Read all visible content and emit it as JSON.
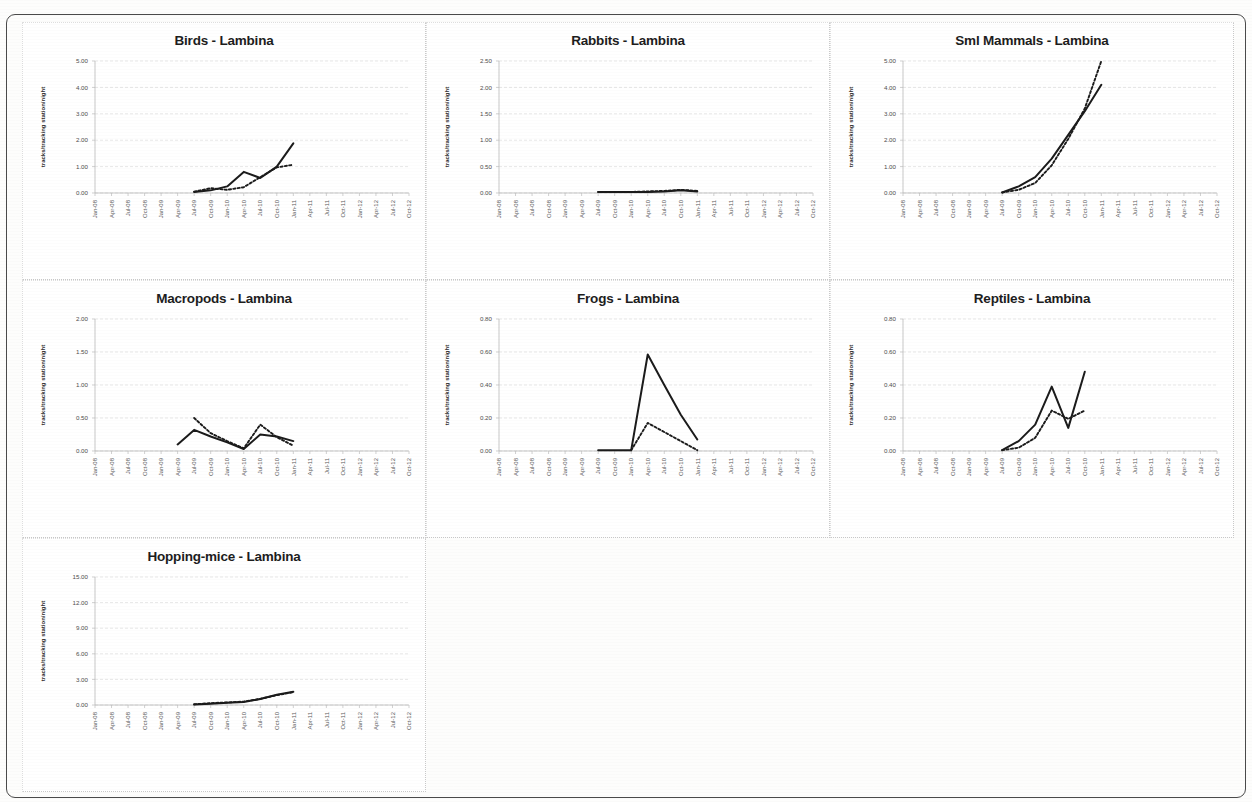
{
  "page": {
    "site": "Lambina",
    "y_axis_label": "tracks/tracking station/night",
    "categories": [
      "Jan-08",
      "Apr-08",
      "Jul-08",
      "Oct-08",
      "Jan-09",
      "Apr-09",
      "Jul-09",
      "Oct-09",
      "Jan-10",
      "Apr-10",
      "Jul-10",
      "Oct-10",
      "Jan-11",
      "Apr-11",
      "Jul-11",
      "Oct-11",
      "Jan-12",
      "Apr-12",
      "Jul-12",
      "Oct-12"
    ],
    "series_names": [
      "observed (solid)",
      "trend (dotted)"
    ],
    "line_color": "#1b1b1b"
  },
  "chart_data": [
    {
      "type": "line",
      "title": "Birds - Lambina",
      "xlabel": "",
      "ylabel": "tracks/tracking station/night",
      "grid": true,
      "legend": "none",
      "ylim": [
        0,
        5
      ],
      "yticks": [
        0,
        1,
        2,
        3,
        4,
        5
      ],
      "ytick_labels": [
        "0.00",
        "1.00",
        "2.00",
        "3.00",
        "4.00",
        "5.00"
      ],
      "categories": [
        "Jan-08",
        "Apr-08",
        "Jul-08",
        "Oct-08",
        "Jan-09",
        "Apr-09",
        "Jul-09",
        "Oct-09",
        "Jan-10",
        "Apr-10",
        "Jul-10",
        "Oct-10",
        "Jan-11",
        "Apr-11",
        "Jul-11",
        "Oct-11",
        "Jan-12",
        "Apr-12",
        "Jul-12",
        "Oct-12"
      ],
      "series": [
        {
          "name": "observed (solid)",
          "style": "solid",
          "x": [
            "Jul-09",
            "Oct-09",
            "Jan-10",
            "Apr-10",
            "Jul-10",
            "Oct-10",
            "Jan-11"
          ],
          "values": [
            0.04,
            0.1,
            0.25,
            0.8,
            0.57,
            1.0,
            1.88
          ]
        },
        {
          "name": "trend (dotted)",
          "style": "dotted",
          "x": [
            "Jul-09",
            "Oct-09",
            "Jan-10",
            "Apr-10",
            "Jul-10",
            "Oct-10",
            "Jan-11"
          ],
          "values": [
            0.05,
            0.18,
            0.12,
            0.22,
            0.6,
            0.97,
            1.07
          ]
        }
      ]
    },
    {
      "type": "line",
      "title": "Rabbits - Lambina",
      "xlabel": "",
      "ylabel": "tracks/tracking station/night",
      "grid": true,
      "legend": "none",
      "ylim": [
        0,
        2.5
      ],
      "yticks": [
        0,
        0.5,
        1.0,
        1.5,
        2.0,
        2.5
      ],
      "ytick_labels": [
        "0.00",
        "0.50",
        "1.00",
        "1.50",
        "2.00",
        "2.50"
      ],
      "categories": [
        "Jan-08",
        "Apr-08",
        "Jul-08",
        "Oct-08",
        "Jan-09",
        "Apr-09",
        "Jul-09",
        "Oct-09",
        "Jan-10",
        "Apr-10",
        "Jul-10",
        "Oct-10",
        "Jan-11",
        "Apr-11",
        "Jul-11",
        "Oct-11",
        "Jan-12",
        "Apr-12",
        "Jul-12",
        "Oct-12"
      ],
      "series": [
        {
          "name": "observed (solid)",
          "style": "solid",
          "x": [
            "Jul-09",
            "Oct-09",
            "Jan-10",
            "Apr-10",
            "Jul-10",
            "Oct-10",
            "Jan-11"
          ],
          "values": [
            0.02,
            0.02,
            0.02,
            0.02,
            0.03,
            0.05,
            0.03
          ]
        },
        {
          "name": "trend (dotted)",
          "style": "dotted",
          "x": [
            "Jul-09",
            "Oct-09",
            "Jan-10",
            "Apr-10",
            "Jul-10",
            "Oct-10",
            "Jan-11"
          ],
          "values": [
            0.02,
            0.02,
            0.02,
            0.03,
            0.04,
            0.06,
            0.04
          ]
        }
      ]
    },
    {
      "type": "line",
      "title": "Sml Mammals - Lambina",
      "xlabel": "",
      "ylabel": "tracks/tracking station/night",
      "grid": true,
      "legend": "none",
      "ylim": [
        0,
        5
      ],
      "yticks": [
        0,
        1,
        2,
        3,
        4,
        5
      ],
      "ytick_labels": [
        "0.00",
        "1.00",
        "2.00",
        "3.00",
        "4.00",
        "5.00"
      ],
      "categories": [
        "Jan-08",
        "Apr-08",
        "Jul-08",
        "Oct-08",
        "Jan-09",
        "Apr-09",
        "Jul-09",
        "Oct-09",
        "Jan-10",
        "Apr-10",
        "Jul-10",
        "Oct-10",
        "Jan-11",
        "Apr-11",
        "Jul-11",
        "Oct-11",
        "Jan-12",
        "Apr-12",
        "Jul-12",
        "Oct-12"
      ],
      "series": [
        {
          "name": "observed (solid)",
          "style": "solid",
          "x": [
            "Jul-09",
            "Oct-09",
            "Jan-10",
            "Apr-10",
            "Jul-10",
            "Oct-10",
            "Jan-11"
          ],
          "values": [
            0.02,
            0.25,
            0.6,
            1.3,
            2.2,
            3.1,
            4.1
          ]
        },
        {
          "name": "trend (dotted)",
          "style": "dotted",
          "x": [
            "Jul-09",
            "Oct-09",
            "Jan-10",
            "Apr-10",
            "Jul-10",
            "Oct-10",
            "Jan-11"
          ],
          "values": [
            0.02,
            0.12,
            0.38,
            1.05,
            2.05,
            3.2,
            5.0
          ]
        }
      ]
    },
    {
      "type": "line",
      "title": "Macropods - Lambina",
      "xlabel": "",
      "ylabel": "tracks/tracking station/night",
      "grid": true,
      "legend": "none",
      "ylim": [
        0,
        2
      ],
      "yticks": [
        0,
        0.5,
        1.0,
        1.5,
        2.0
      ],
      "ytick_labels": [
        "0.00",
        "0.50",
        "1.00",
        "1.50",
        "2.00"
      ],
      "categories": [
        "Jan-08",
        "Apr-08",
        "Jul-08",
        "Oct-08",
        "Jan-09",
        "Apr-09",
        "Jul-09",
        "Oct-09",
        "Jan-10",
        "Apr-10",
        "Jul-10",
        "Oct-10",
        "Jan-11",
        "Apr-11",
        "Jul-11",
        "Oct-11",
        "Jan-12",
        "Apr-12",
        "Jul-12",
        "Oct-12"
      ],
      "series": [
        {
          "name": "observed (solid)",
          "style": "solid",
          "x": [
            "Apr-09",
            "Jul-09",
            "Oct-09",
            "Jan-10",
            "Apr-10",
            "Jul-10",
            "Oct-10",
            "Jan-11"
          ],
          "values": [
            0.1,
            0.32,
            0.22,
            0.13,
            0.03,
            0.25,
            0.22,
            0.15
          ]
        },
        {
          "name": "trend (dotted)",
          "style": "dotted",
          "x": [
            "Jul-09",
            "Oct-09",
            "Jan-10",
            "Apr-10",
            "Jul-10",
            "Oct-10",
            "Jan-11"
          ],
          "values": [
            0.5,
            0.27,
            0.15,
            0.04,
            0.4,
            0.21,
            0.08
          ]
        }
      ]
    },
    {
      "type": "line",
      "title": "Frogs - Lambina",
      "xlabel": "",
      "ylabel": "tracks/tracking station/night",
      "grid": true,
      "legend": "none",
      "ylim": [
        0,
        0.8
      ],
      "yticks": [
        0,
        0.2,
        0.4,
        0.6,
        0.8
      ],
      "ytick_labels": [
        "0.00",
        "0.20",
        "0.40",
        "0.60",
        "0.80"
      ],
      "categories": [
        "Jan-08",
        "Apr-08",
        "Jul-08",
        "Oct-08",
        "Jan-09",
        "Apr-09",
        "Jul-09",
        "Oct-09",
        "Jan-10",
        "Apr-10",
        "Jul-10",
        "Oct-10",
        "Jan-11",
        "Apr-11",
        "Jul-11",
        "Oct-11",
        "Jan-12",
        "Apr-12",
        "Jul-12",
        "Oct-12"
      ],
      "series": [
        {
          "name": "observed (solid)",
          "style": "solid",
          "x": [
            "Jul-09",
            "Oct-09",
            "Jan-10",
            "Apr-10",
            "Jul-10",
            "Oct-10",
            "Jan-11"
          ],
          "values": [
            0.005,
            0.005,
            0.005,
            0.585,
            0.4,
            0.22,
            0.07
          ]
        },
        {
          "name": "trend (dotted)",
          "style": "dotted",
          "x": [
            "Jan-10",
            "Apr-10",
            "Jul-10",
            "Oct-10",
            "Jan-11"
          ],
          "values": [
            0.005,
            0.17,
            0.115,
            0.06,
            0.005
          ]
        }
      ]
    },
    {
      "type": "line",
      "title": "Reptiles - Lambina",
      "xlabel": "",
      "ylabel": "tracks/tracking station/night",
      "grid": true,
      "legend": "none",
      "ylim": [
        0,
        0.8
      ],
      "yticks": [
        0,
        0.2,
        0.4,
        0.6,
        0.8
      ],
      "ytick_labels": [
        "0.00",
        "0.20",
        "0.40",
        "0.60",
        "0.80"
      ],
      "categories": [
        "Jan-08",
        "Apr-08",
        "Jul-08",
        "Oct-08",
        "Jan-09",
        "Apr-09",
        "Jul-09",
        "Oct-09",
        "Jan-10",
        "Apr-10",
        "Jul-10",
        "Oct-10",
        "Jan-11",
        "Apr-11",
        "Jul-11",
        "Oct-11",
        "Jan-12",
        "Apr-12",
        "Jul-12",
        "Oct-12"
      ],
      "series": [
        {
          "name": "observed (solid)",
          "style": "solid",
          "x": [
            "Jul-09",
            "Oct-09",
            "Jan-10",
            "Apr-10",
            "Jul-10",
            "Oct-10"
          ],
          "values": [
            0.005,
            0.06,
            0.16,
            0.39,
            0.14,
            0.48
          ]
        },
        {
          "name": "trend (dotted)",
          "style": "dotted",
          "x": [
            "Jul-09",
            "Oct-09",
            "Jan-10",
            "Apr-10",
            "Jul-10",
            "Oct-10"
          ],
          "values": [
            0.005,
            0.02,
            0.08,
            0.245,
            0.195,
            0.245
          ]
        }
      ]
    },
    {
      "type": "line",
      "title": "Hopping-mice - Lambina",
      "xlabel": "",
      "ylabel": "tracks/tracking station/night",
      "grid": true,
      "legend": "none",
      "ylim": [
        0,
        15
      ],
      "yticks": [
        0,
        3,
        6,
        9,
        12,
        15
      ],
      "ytick_labels": [
        "0.00",
        "3.00",
        "6.00",
        "9.00",
        "12.00",
        "15.00"
      ],
      "categories": [
        "Jan-08",
        "Apr-08",
        "Jul-08",
        "Oct-08",
        "Jan-09",
        "Apr-09",
        "Jul-09",
        "Oct-09",
        "Jan-10",
        "Apr-10",
        "Jul-10",
        "Oct-10",
        "Jan-11",
        "Apr-11",
        "Jul-11",
        "Oct-11",
        "Jan-12",
        "Apr-12",
        "Jul-12",
        "Oct-12"
      ],
      "series": [
        {
          "name": "observed (solid)",
          "style": "solid",
          "x": [
            "Jul-09",
            "Oct-09",
            "Jan-10",
            "Apr-10",
            "Jul-10",
            "Oct-10",
            "Jan-11"
          ],
          "values": [
            0.05,
            0.15,
            0.25,
            0.35,
            0.7,
            1.2,
            1.55
          ]
        },
        {
          "name": "trend (dotted)",
          "style": "dotted",
          "x": [
            "Jul-09",
            "Oct-09",
            "Jan-10",
            "Apr-10",
            "Jul-10",
            "Oct-10",
            "Jan-11"
          ],
          "values": [
            0.08,
            0.22,
            0.3,
            0.4,
            0.72,
            1.15,
            1.5
          ]
        }
      ]
    }
  ]
}
